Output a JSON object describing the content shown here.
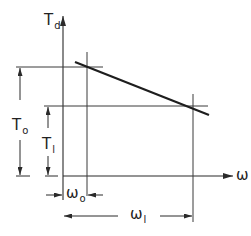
{
  "diagram": {
    "colors": {
      "line": "#2a2a2a",
      "thin": "#3a3a3a",
      "background": "#ffffff"
    },
    "axes": {
      "y_label": {
        "main": "T",
        "sub": "d"
      },
      "x_label": {
        "main": "ω"
      }
    },
    "levels": {
      "t0": {
        "main": "T",
        "sub": "o"
      },
      "t1": {
        "main": "T",
        "sub": "l"
      }
    },
    "frequencies": {
      "w0": {
        "main": "ω",
        "sub": "o"
      },
      "w1": {
        "main": "ω",
        "sub": "l"
      }
    },
    "curve": {
      "description": "Linear decreasing characteristic from (ω0, T0) to (ω1, T1)"
    }
  }
}
